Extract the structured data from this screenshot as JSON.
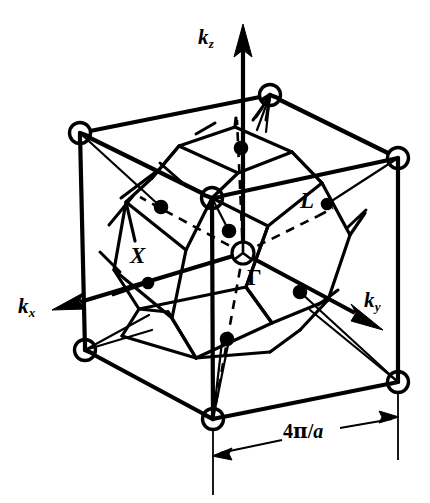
{
  "figure": {
    "background_color": "#ffffff",
    "line_color": "#000000"
  },
  "axes": {
    "kz": {
      "label_main": "k",
      "label_sub": "z",
      "direction": "up"
    },
    "kx": {
      "label_main": "k",
      "label_sub": "x",
      "direction": "down-left"
    },
    "ky": {
      "label_main": "k",
      "label_sub": "y",
      "direction": "down-right"
    }
  },
  "symmetry_points": {
    "gamma": {
      "label": "Γ",
      "name": "zone-centre"
    },
    "x_point": {
      "label": "X",
      "name": "square-face-centre"
    },
    "l_point": {
      "label": "L",
      "name": "hexagonal-face-centre"
    }
  },
  "dimension": {
    "value": "4π/a",
    "value_prefix": "4",
    "value_pi": "π",
    "value_slash": "/",
    "value_a": "a",
    "describes": "cube-edge-length"
  },
  "geometry": {
    "cube_vertices_marked": 8,
    "polyhedron": "truncated-octahedron",
    "square_faces": 6,
    "hexagonal_faces": 8
  }
}
